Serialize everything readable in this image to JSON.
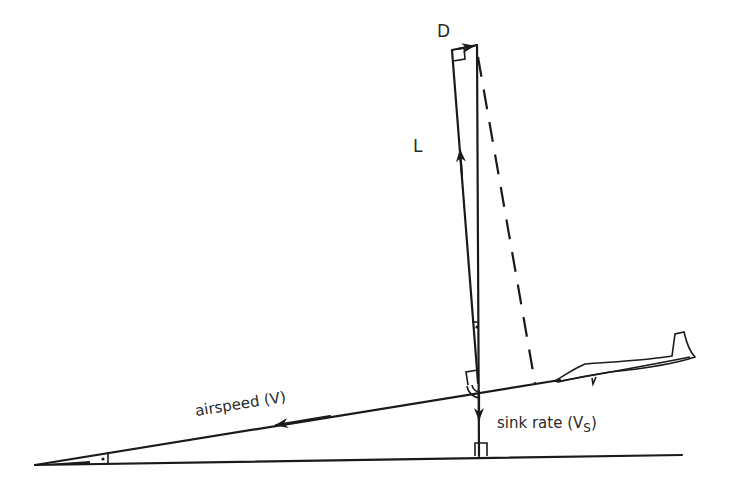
{
  "diagram": {
    "labels": {
      "drag": "D",
      "lift": "L",
      "airspeed": "airspeed (V)",
      "sink_rate_prefix": "sink rate (V",
      "sink_rate_subscript": "S",
      "sink_rate_suffix": ")"
    },
    "elements": [
      {
        "id": "horizontal-ground-line",
        "type": "line",
        "from": [
          35,
          464
        ],
        "to": [
          680,
          455
        ]
      },
      {
        "id": "flight-path-line",
        "type": "line",
        "from": [
          35,
          464
        ],
        "to": [
          560,
          380
        ]
      },
      {
        "id": "airspeed-vector",
        "type": "arrow",
        "direction": "along flight path, pointing down-left"
      },
      {
        "id": "sink-rate-vector",
        "type": "arrow",
        "from": [
          478,
          383
        ],
        "to": [
          479,
          418
        ],
        "direction": "down"
      },
      {
        "id": "lift-vector",
        "type": "arrow",
        "from": [
          478,
          383
        ],
        "to": [
          452,
          50
        ],
        "direction": "up, perpendicular to flight path"
      },
      {
        "id": "drag-vector",
        "type": "arrow",
        "from": [
          452,
          50
        ],
        "to": [
          477,
          45
        ],
        "direction": "right, parallel to flight path"
      },
      {
        "id": "resultant-vertical",
        "type": "line",
        "from": [
          477,
          45
        ],
        "to": [
          479,
          455
        ]
      },
      {
        "id": "dashed-projection",
        "type": "dashed-line",
        "from": [
          478,
          57
        ],
        "to": [
          535,
          383
        ]
      },
      {
        "id": "glider",
        "type": "outline",
        "position": [
          555,
          330
        ]
      }
    ],
    "markers": {
      "right_angle_markers": 4,
      "angle_dots": 2,
      "angle_arcs": 2
    },
    "colors": {
      "ink": "#1a1a1a",
      "background": "#ffffff"
    }
  }
}
